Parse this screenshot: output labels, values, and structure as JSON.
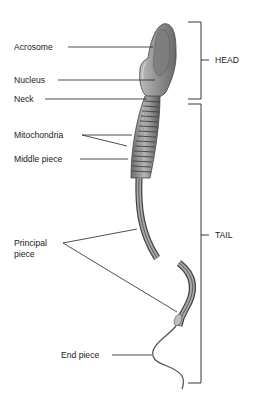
{
  "diagram": {
    "labels": {
      "acrosome": "Acrosome",
      "nucleus": "Nucleus",
      "neck": "Neck",
      "mitochondria": "Mitochondria",
      "middle_piece": "Middle piece",
      "principal_piece_line1": "Principal",
      "principal_piece_line2": "piece",
      "end_piece": "End piece"
    },
    "regions": {
      "head": "HEAD",
      "tail": "TAIL"
    },
    "colors": {
      "cell_fill": "#9a9a9a",
      "cell_dark": "#555555",
      "cell_light": "#c8c8c8",
      "line": "#222222"
    }
  }
}
